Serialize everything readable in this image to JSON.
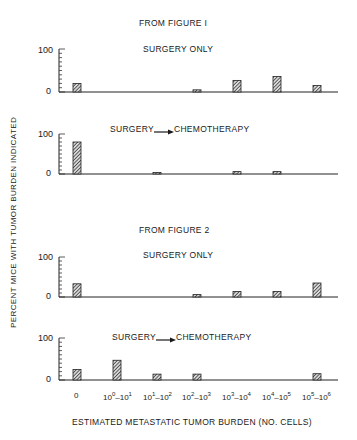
{
  "y_axis_label": "PERCENT MICE WITH TUMOR BURDEN INDICATED",
  "x_axis_label": "ESTIMATED METASTATIC TUMOR BURDEN (NO. CELLS)",
  "figures": [
    {
      "title": "FROM FIGURE I"
    },
    {
      "title": "FROM FIGURE 2"
    }
  ],
  "panels": [
    {
      "title": "SURGERY ONLY",
      "has_arrow": false
    },
    {
      "title_left": "SURGERY",
      "title_right": "CHEMOTHERAPY",
      "has_arrow": true
    },
    {
      "title": "SURGERY ONLY",
      "has_arrow": false
    },
    {
      "title_left": "SURGERY",
      "title_right": "CHEMOTHERAPY",
      "has_arrow": true
    }
  ],
  "ticks": {
    "top": "100",
    "bottom": "0"
  },
  "categories": [
    {
      "base": "0",
      "label": "0"
    },
    {
      "a": "10",
      "ae": "0",
      "b": "10",
      "be": "1",
      "label": "10^0-10^1"
    },
    {
      "a": "10",
      "ae": "1",
      "b": "10",
      "be": "2",
      "label": "10^1-10^2"
    },
    {
      "a": "10",
      "ae": "2",
      "b": "10",
      "be": "3",
      "label": "10^2-10^3"
    },
    {
      "a": "10",
      "ae": "3",
      "b": "10",
      "be": "4",
      "label": "10^3-10^4"
    },
    {
      "a": "10",
      "ae": "4",
      "b": "10",
      "be": "5",
      "label": "10^4-10^5"
    },
    {
      "a": "10",
      "ae": "5",
      "b": "10",
      "be": "6",
      "label": "10^5-10^6"
    }
  ],
  "chart_data": [
    {
      "type": "bar",
      "title": "FROM FIGURE I — SURGERY ONLY",
      "categories": [
        "0",
        "10^0-10^1",
        "10^1-10^2",
        "10^2-10^3",
        "10^3-10^4",
        "10^4-10^5",
        "10^5-10^6"
      ],
      "values": [
        20,
        0,
        0,
        5,
        27,
        36,
        15
      ],
      "xlabel": "ESTIMATED METASTATIC TUMOR BURDEN (NO. CELLS)",
      "ylabel": "PERCENT MICE WITH TUMOR BURDEN INDICATED",
      "ylim": [
        0,
        100
      ],
      "grid": false,
      "legend": "none"
    },
    {
      "type": "bar",
      "title": "FROM FIGURE I — SURGERY → CHEMOTHERAPY",
      "categories": [
        "0",
        "10^0-10^1",
        "10^1-10^2",
        "10^2-10^3",
        "10^3-10^4",
        "10^4-10^5",
        "10^5-10^6"
      ],
      "values": [
        80,
        0,
        4,
        0,
        6,
        6,
        0
      ],
      "xlabel": "ESTIMATED METASTATIC TUMOR BURDEN (NO. CELLS)",
      "ylabel": "PERCENT MICE WITH TUMOR BURDEN INDICATED",
      "ylim": [
        0,
        100
      ],
      "grid": false,
      "legend": "none"
    },
    {
      "type": "bar",
      "title": "FROM FIGURE 2 — SURGERY ONLY",
      "categories": [
        "0",
        "10^0-10^1",
        "10^1-10^2",
        "10^2-10^3",
        "10^3-10^4",
        "10^4-10^5",
        "10^5-10^6"
      ],
      "values": [
        33,
        0,
        0,
        6,
        14,
        14,
        35
      ],
      "xlabel": "ESTIMATED METASTATIC TUMOR BURDEN (NO. CELLS)",
      "ylabel": "PERCENT MICE WITH TUMOR BURDEN INDICATED",
      "ylim": [
        0,
        100
      ],
      "grid": false,
      "legend": "none"
    },
    {
      "type": "bar",
      "title": "FROM FIGURE 2 — SURGERY → CHEMOTHERAPY",
      "categories": [
        "0",
        "10^0-10^1",
        "10^1-10^2",
        "10^2-10^3",
        "10^3-10^4",
        "10^4-10^5",
        "10^5-10^6"
      ],
      "values": [
        25,
        47,
        14,
        14,
        0,
        0,
        15
      ],
      "xlabel": "ESTIMATED METASTATIC TUMOR BURDEN (NO. CELLS)",
      "ylabel": "PERCENT MICE WITH TUMOR BURDEN INDICATED",
      "ylim": [
        0,
        100
      ],
      "grid": false,
      "legend": "none"
    }
  ]
}
